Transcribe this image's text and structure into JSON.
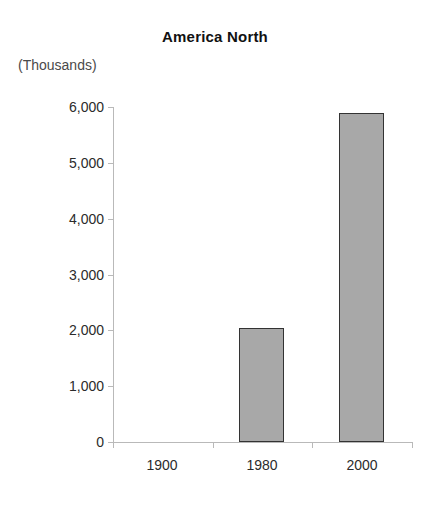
{
  "chart_data": {
    "type": "bar",
    "title": "America North",
    "subtitle": "",
    "unit_label": "(Thousands)",
    "xlabel": "",
    "ylabel": "",
    "categories": [
      "1900",
      "1980",
      "2000"
    ],
    "values": [
      0,
      2050,
      5900
    ],
    "series": [
      {
        "name": "America North",
        "values": [
          0,
          2050,
          5900
        ]
      }
    ],
    "ylim": [
      0,
      6000
    ],
    "y_ticks": [
      0,
      1000,
      2000,
      3000,
      4000,
      5000,
      6000
    ],
    "y_tick_labels": [
      "0",
      "1,000",
      "2,000",
      "3,000",
      "4,000",
      "5,000",
      "6,000"
    ],
    "x_tick_labels": [
      "1900",
      "1980",
      "2000"
    ],
    "grid": false,
    "legend": false,
    "legend_position": "none",
    "colors": {
      "bar_fill": "#a8a8a8",
      "bar_border": "#333333",
      "axis": "#b9b9b9",
      "text": "#2b2b2b",
      "title": "#111111",
      "background": "#ffffff"
    },
    "annotations": []
  }
}
